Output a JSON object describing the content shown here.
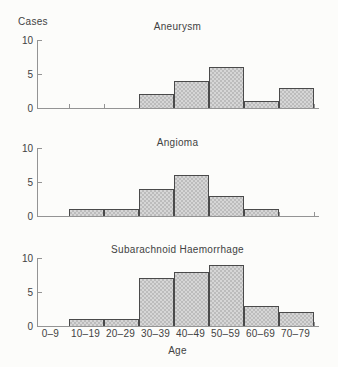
{
  "figure": {
    "y_axis_label": "Cases",
    "x_axis_label": "Age",
    "y_tick_labels": [
      "10",
      "5",
      "0"
    ],
    "categories": [
      "0–9",
      "10–19",
      "20–29",
      "30–39",
      "40–49",
      "50–59",
      "60–69",
      "70–79"
    ]
  },
  "chart_data": [
    {
      "type": "bar",
      "title": "Aneurysm",
      "categories": [
        "0–9",
        "10–19",
        "20–29",
        "30–39",
        "40–49",
        "50–59",
        "60–69",
        "70–79"
      ],
      "values": [
        0,
        0,
        0,
        2,
        4,
        6,
        1,
        3
      ],
      "xlabel": "Age",
      "ylabel": "Cases",
      "ylim": [
        0,
        10
      ],
      "yticks": [
        0,
        5,
        10
      ],
      "grid": false,
      "legend": "none"
    },
    {
      "type": "bar",
      "title": "Angioma",
      "categories": [
        "0–9",
        "10–19",
        "20–29",
        "30–39",
        "40–49",
        "50–59",
        "60–69",
        "70–79"
      ],
      "values": [
        0,
        1,
        1,
        4,
        6,
        3,
        1,
        0
      ],
      "xlabel": "Age",
      "ylabel": "Cases",
      "ylim": [
        0,
        10
      ],
      "yticks": [
        0,
        5,
        10
      ],
      "grid": false,
      "legend": "none"
    },
    {
      "type": "bar",
      "title": "Subarachnoid Haemorrhage",
      "categories": [
        "0–9",
        "10–19",
        "20–29",
        "30–39",
        "40–49",
        "50–59",
        "60–69",
        "70–79"
      ],
      "values": [
        0,
        1,
        1,
        7,
        8,
        9,
        3,
        2
      ],
      "xlabel": "Age",
      "ylabel": "Cases",
      "ylim": [
        0,
        10
      ],
      "yticks": [
        0,
        5,
        10
      ],
      "grid": false,
      "legend": "none"
    }
  ],
  "colors": {
    "background": "#fcfcfa",
    "axis": "#949494",
    "bar_border": "#4a4a4a",
    "bar_fill": "#d6d6d6",
    "bar_stipple": "#bcbcbc",
    "text": "#424242"
  }
}
